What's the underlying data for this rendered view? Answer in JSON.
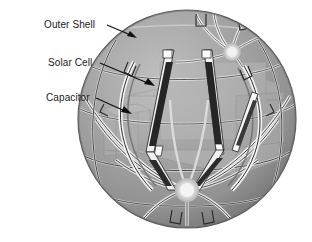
{
  "figure": {
    "background_color": "#ffffff"
  },
  "labels": [
    {
      "id": "outer-shell",
      "text": "Outer Shell",
      "leader": "arrow-right-down"
    },
    {
      "id": "solar-cell",
      "text": "Solar Cell",
      "leader": "arrow-right-down"
    },
    {
      "id": "capacitor",
      "text": "Capacitor",
      "leader": "arrow-right-down"
    }
  ],
  "label_text": {
    "outer_shell": "Outer Shell",
    "solar_cell": "Solar Cell",
    "capacitor": "Capacitor"
  },
  "colors": {
    "background": "#ffffff",
    "shell_fill": "#9b9b9b",
    "shell_fill_light": "#b2b2b2",
    "shell_edge": "#6a6a6a",
    "shell_shadow": "#7d7d7d",
    "capacitor_box": "#aaaaaa",
    "capacitor_box_light": "#b8b8b8",
    "solar_cell_dark": "#2b2b2b",
    "solar_cell_light": "#f2f2f2",
    "rib_light": "#e8e8e8",
    "rib_dark": "#3c3c3c",
    "hub": "#dcdcdc",
    "label_text": "#1a1a1a",
    "leader_line": "#111111"
  },
  "geometry": {
    "sphere_center_x": 187,
    "sphere_center_y": 119,
    "sphere_radius_x": 109,
    "sphere_radius_y": 109,
    "rib_count": 10,
    "latitude_band_count": 4,
    "solar_cell_count": 4
  }
}
